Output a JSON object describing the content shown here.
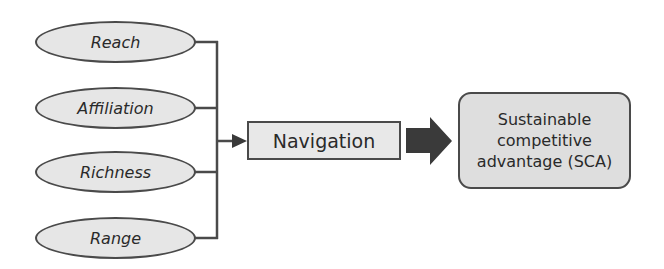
{
  "diagram": {
    "inputs": [
      {
        "label": "Reach"
      },
      {
        "label": "Affiliation"
      },
      {
        "label": "Richness"
      },
      {
        "label": "Range"
      }
    ],
    "process": {
      "label": "Navigation"
    },
    "outcome": {
      "lines": [
        "Sustainable",
        "competitive",
        "advantage (SCA)"
      ]
    },
    "colors": {
      "stroke": "#4a4a4a",
      "ellipse_fill": "#e6e6e6",
      "nav_fill": "#e8e8e8",
      "sca_fill": "#dedede",
      "big_arrow": "#3a3a3a"
    }
  }
}
